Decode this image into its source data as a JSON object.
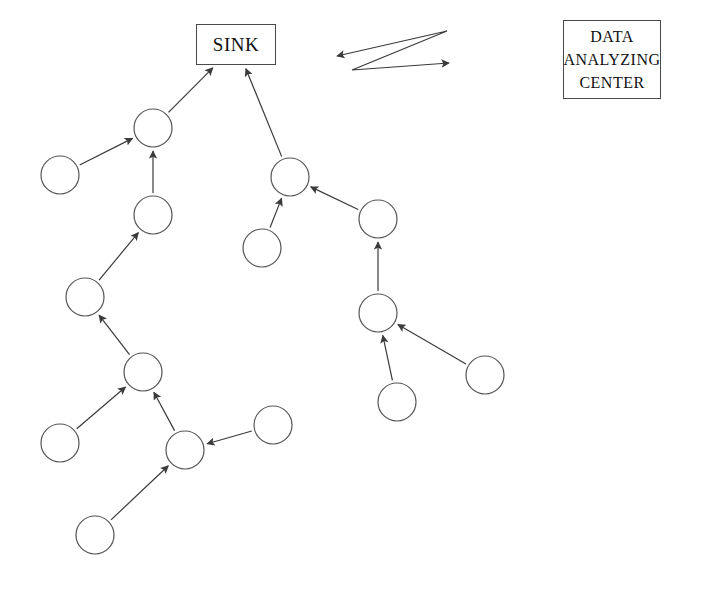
{
  "diagram": {
    "canvas": {
      "width": 702,
      "height": 594
    },
    "style": {
      "node_stroke": "#555555",
      "node_fill": "#ffffff",
      "node_radius": 19,
      "edge_stroke": "#3a3a3a",
      "box_stroke": "#4a4a4a",
      "background": "#ffffff"
    },
    "boxes": [
      {
        "id": "sink",
        "label": "SINK",
        "x": 196,
        "y": 24,
        "width": 80,
        "height": 41
      },
      {
        "id": "data_analyzing_center",
        "lines": [
          "DATA",
          "ANALYZING",
          "CENTER"
        ],
        "x": 563,
        "y": 20,
        "width": 98,
        "height": 79
      }
    ],
    "nodes": [
      {
        "id": "n1",
        "cx": 60,
        "cy": 175
      },
      {
        "id": "n2",
        "cx": 153,
        "cy": 128
      },
      {
        "id": "n3",
        "cx": 153,
        "cy": 215
      },
      {
        "id": "n4",
        "cx": 85,
        "cy": 297
      },
      {
        "id": "n5",
        "cx": 143,
        "cy": 372
      },
      {
        "id": "n6",
        "cx": 60,
        "cy": 443
      },
      {
        "id": "n7",
        "cx": 185,
        "cy": 450
      },
      {
        "id": "n8",
        "cx": 95,
        "cy": 535
      },
      {
        "id": "n9",
        "cx": 273,
        "cy": 425
      },
      {
        "id": "n10",
        "cx": 290,
        "cy": 177
      },
      {
        "id": "n11",
        "cx": 262,
        "cy": 248
      },
      {
        "id": "n12",
        "cx": 378,
        "cy": 219
      },
      {
        "id": "n13",
        "cx": 378,
        "cy": 313
      },
      {
        "id": "n14",
        "cx": 397,
        "cy": 402
      },
      {
        "id": "n15",
        "cx": 485,
        "cy": 375
      }
    ],
    "edges": [
      {
        "id": "e1",
        "from": "n1",
        "to": "n2"
      },
      {
        "id": "e2",
        "from": "n3",
        "to": "n2"
      },
      {
        "id": "e3",
        "from": "n2",
        "to": "sink"
      },
      {
        "id": "e4",
        "from": "n4",
        "to": "n3"
      },
      {
        "id": "e5",
        "from": "n5",
        "to": "n4"
      },
      {
        "id": "e6",
        "from": "n6",
        "to": "n5"
      },
      {
        "id": "e7",
        "from": "n7",
        "to": "n5"
      },
      {
        "id": "e8",
        "from": "n8",
        "to": "n7"
      },
      {
        "id": "e9",
        "from": "n9",
        "to": "n7"
      },
      {
        "id": "e10",
        "from": "n10",
        "to": "sink"
      },
      {
        "id": "e11",
        "from": "n11",
        "to": "n10"
      },
      {
        "id": "e12",
        "from": "n12",
        "to": "n10"
      },
      {
        "id": "e13",
        "from": "n13",
        "to": "n12"
      },
      {
        "id": "e14",
        "from": "n14",
        "to": "n13"
      },
      {
        "id": "e15",
        "from": "n15",
        "to": "n13"
      }
    ],
    "wireless_link": {
      "id": "sink-to-center-link",
      "description": "zigzag double-headed arrow",
      "points": [
        {
          "x": 337,
          "y": 56
        },
        {
          "x": 447,
          "y": 31
        },
        {
          "x": 352,
          "y": 70
        },
        {
          "x": 449,
          "y": 63
        }
      ],
      "arrow_start": true,
      "arrow_end": true
    }
  }
}
